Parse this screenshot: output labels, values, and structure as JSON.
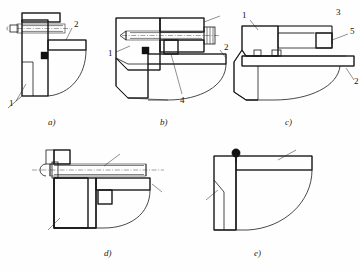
{
  "drawing": {
    "title": "Sectional detail views a) through e)",
    "background_color": "#ffffff",
    "line_color": "#1a1a1a",
    "figure_count": 5
  },
  "figures": [
    {
      "id": "a",
      "caption": "a)",
      "callouts": [
        {
          "number": "2",
          "position": "upper-right"
        },
        {
          "number": "1",
          "position": "lower-left"
        }
      ],
      "components": [
        "bolt",
        "hatched-body",
        "flange",
        "seal-marker",
        "curved-profile"
      ]
    },
    {
      "id": "b",
      "caption": "b)",
      "callouts": [
        {
          "number": "3",
          "position": "upper-right"
        },
        {
          "number": "2",
          "position": "right"
        },
        {
          "number": "1",
          "position": "left"
        },
        {
          "number": "4",
          "position": "bottom"
        }
      ],
      "components": [
        "knurled-screw",
        "hatched-body",
        "dowel-block",
        "flange",
        "seal-marker",
        "curved-profile"
      ]
    },
    {
      "id": "c",
      "caption": "c)",
      "callouts": [
        {
          "number": "1",
          "position": "upper-left"
        },
        {
          "number": "5",
          "position": "right"
        },
        {
          "number": "2",
          "position": "lower-right"
        }
      ],
      "components": [
        "hatched-body",
        "cavity",
        "crosshatched-insert",
        "base-plate",
        "curved-profile"
      ]
    },
    {
      "id": "d",
      "caption": "d)",
      "callouts": [
        {
          "number": "6",
          "position": "top"
        },
        {
          "number": "2",
          "position": "right"
        },
        {
          "number": "1",
          "position": "lower-left"
        }
      ],
      "components": [
        "long-shaft",
        "bolt-head",
        "hatched-body",
        "flange",
        "crosshatched-dowel",
        "curved-profile"
      ]
    },
    {
      "id": "e",
      "caption": "e)",
      "callouts": [
        {
          "number": "2",
          "position": "upper-right"
        },
        {
          "number": "1",
          "position": "left"
        }
      ],
      "components": [
        "L-bracket",
        "hatched-body",
        "weld-dot-marker",
        "curved-profile"
      ]
    }
  ]
}
